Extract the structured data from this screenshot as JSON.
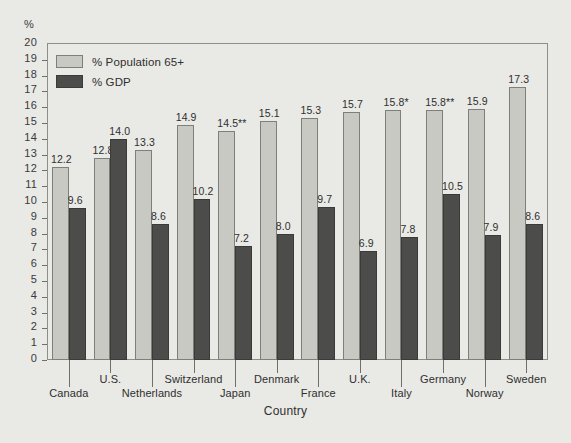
{
  "axis": {
    "unit_label": "%",
    "x_title": "Country",
    "y_ticks": [
      "20",
      "19",
      "18",
      "17",
      "16",
      "15",
      "14",
      "13",
      "12",
      "11",
      "10",
      "9",
      "8",
      "7",
      "6",
      "5",
      "4",
      "3",
      "2",
      "1",
      "0"
    ],
    "ylim": [
      0,
      20
    ]
  },
  "legend": {
    "items": [
      {
        "label": "% Population 65+",
        "color": "#c9c9c4",
        "key": "pop"
      },
      {
        "label": "% GDP",
        "color": "#4c4c4a",
        "key": "gdp"
      }
    ]
  },
  "chart_data": {
    "type": "bar",
    "title": "",
    "xlabel": "Country",
    "ylabel": "%",
    "ylim": [
      0,
      20
    ],
    "grid": false,
    "legend_position": "top-left-inside",
    "categories": [
      "Canada",
      "U.S.",
      "Netherlands",
      "Switzerland",
      "Japan",
      "Denmark",
      "France",
      "U.K.",
      "Italy",
      "Germany",
      "Norway",
      "Sweden"
    ],
    "series": [
      {
        "name": "% Population 65+",
        "color": "#c9c9c4",
        "values": [
          12.2,
          12.8,
          13.3,
          14.9,
          14.5,
          15.1,
          15.3,
          15.7,
          15.8,
          15.8,
          15.9,
          17.3
        ],
        "labels": [
          "12.2",
          "12.8",
          "13.3",
          "14.9",
          "14.5**",
          "15.1",
          "15.3",
          "15.7",
          "15.8*",
          "15.8**",
          "15.9",
          "17.3"
        ]
      },
      {
        "name": "% GDP",
        "color": "#4c4c4a",
        "values": [
          9.6,
          14.0,
          8.6,
          10.2,
          7.2,
          8.0,
          9.7,
          6.9,
          7.8,
          10.5,
          7.9,
          8.6
        ],
        "labels": [
          "9.6",
          "14.0",
          "8.6",
          "10.2",
          "7.2",
          "8.0",
          "9.7",
          "6.9",
          "7.8",
          "10.5",
          "7.9",
          "8.6"
        ]
      }
    ]
  },
  "x_label_rows": [
    2,
    1,
    2,
    1,
    2,
    1,
    2,
    1,
    2,
    1,
    2,
    1
  ]
}
